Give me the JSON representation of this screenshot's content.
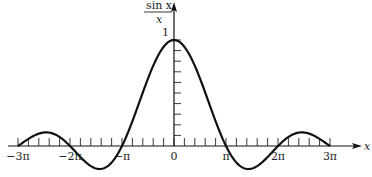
{
  "chart_data": {
    "type": "line",
    "title": "",
    "function": "sin(x)/x",
    "xlabel": "x",
    "ylabel": {
      "numerator": "sin  x",
      "denominator": "x"
    },
    "xlim_pi_multiples": [
      -3,
      3
    ],
    "ylim": [
      -0.23,
      1.25
    ],
    "x_tick_step_pi_fraction": 0.2,
    "y_tick_step": 0.1,
    "grid": false,
    "legend": "none",
    "x_tick_labels": [
      {
        "value_pi": -3,
        "label": "−3π"
      },
      {
        "value_pi": -2,
        "label": "−2π"
      },
      {
        "value_pi": -1,
        "label": "−π"
      },
      {
        "value_pi": 0,
        "label": "0"
      },
      {
        "value_pi": 1,
        "label": "π"
      },
      {
        "value_pi": 2,
        "label": "2π"
      },
      {
        "value_pi": 3,
        "label": "3π"
      }
    ],
    "y_tick_labels": [
      {
        "value": 1,
        "label": "1"
      }
    ],
    "series": [
      {
        "name": "sin x / x",
        "x": [
          -9.4248,
          -7.7253,
          -6.2832,
          -4.4934,
          -3.1416,
          0,
          3.1416,
          4.4934,
          6.2832,
          7.7253,
          9.4248
        ],
        "values": [
          0,
          0.1284,
          0,
          -0.2172,
          0,
          1,
          0,
          -0.2172,
          0,
          0.1284,
          0
        ]
      }
    ]
  }
}
